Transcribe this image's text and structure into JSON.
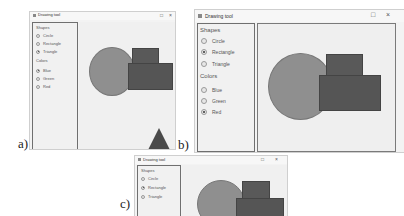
{
  "captions": {
    "a": "a)",
    "b": "b)",
    "c": "c)"
  },
  "window": {
    "title": "Drawing tool",
    "maximize_icon": "□",
    "close_icon": "×"
  },
  "sidebar": {
    "shapes_label": "Shapes",
    "shapes": [
      "Circle",
      "Rectangle",
      "Triangle"
    ],
    "colors_label": "Colors",
    "colors": [
      "Blue",
      "Green",
      "Red"
    ]
  },
  "panels": {
    "a": {
      "selected_shape": "Triangle",
      "selected_color": "Blue"
    },
    "b": {
      "selected_shape": "Rectangle",
      "selected_color": "Red"
    },
    "c": {
      "selected_shape": "Rectangle"
    }
  },
  "colors": {
    "circle_fill": "#8f8f8f",
    "rect_fill": "#555555",
    "triangle_fill": "#4a4a4a"
  }
}
